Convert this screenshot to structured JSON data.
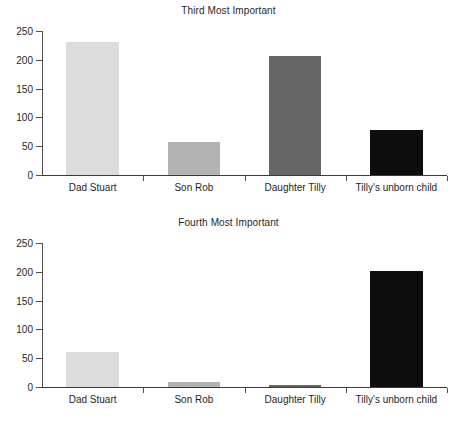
{
  "chart_data": [
    {
      "type": "bar",
      "title": "Third Most Important",
      "xlabel": "",
      "ylabel": "",
      "ylim": [
        0,
        250
      ],
      "yticks": [
        0,
        50,
        100,
        150,
        200,
        250
      ],
      "grid": false,
      "legend": "none",
      "categories": [
        "Dad Stuart",
        "Son Rob",
        "Daughter Tilly",
        "Tilly's unborn child"
      ],
      "values": [
        231,
        57,
        206,
        78
      ],
      "bar_colors": [
        "#dcdcdc",
        "#b3b3b3",
        "#666666",
        "#0d0d0d"
      ]
    },
    {
      "type": "bar",
      "title": "Fourth Most Important",
      "xlabel": "",
      "ylabel": "",
      "ylim": [
        0,
        250
      ],
      "yticks": [
        0,
        50,
        100,
        150,
        200,
        250
      ],
      "grid": false,
      "legend": "none",
      "categories": [
        "Dad Stuart",
        "Son Rob",
        "Daughter Tilly",
        "Tilly's unborn child"
      ],
      "values": [
        60,
        8,
        4,
        202
      ],
      "bar_colors": [
        "#dcdcdc",
        "#b3b3b3",
        "#666666",
        "#0d0d0d"
      ]
    }
  ],
  "charts": {
    "top": {
      "title": "Third Most Important",
      "yticks": [
        "0",
        "50",
        "100",
        "150",
        "200",
        "250"
      ],
      "categories": [
        "Dad Stuart",
        "Son Rob",
        "Daughter Tilly",
        "Tilly's unborn child"
      ]
    },
    "bottom": {
      "title": "Fourth Most Important",
      "yticks": [
        "0",
        "50",
        "100",
        "150",
        "200",
        "250"
      ],
      "categories": [
        "Dad Stuart",
        "Son Rob",
        "Daughter Tilly",
        "Tilly's unborn child"
      ]
    }
  }
}
